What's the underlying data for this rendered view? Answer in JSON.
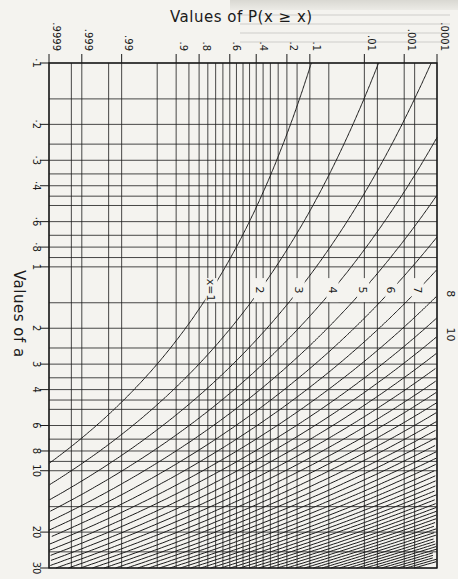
{
  "chart_data": {
    "type": "line",
    "title": "Values of P(x ≥ x)",
    "xlabel": "Values of P(x ≥ x)",
    "ylabel": "Values of a",
    "x_axis": {
      "scale": "normal-probability",
      "position": "top",
      "ticks": [
        ".9999",
        ".999",
        ".99",
        ".9",
        ".8",
        ".6",
        ".4",
        ".2",
        ".1",
        ".01",
        ".001",
        ".0001"
      ],
      "tick_values": [
        0.9999,
        0.999,
        0.99,
        0.9,
        0.8,
        0.6,
        0.4,
        0.2,
        0.1,
        0.01,
        0.001,
        0.0001
      ],
      "minor_gridlines": [
        0.9995,
        0.995,
        0.95,
        0.85,
        0.75,
        0.7,
        0.65,
        0.55,
        0.5,
        0.45,
        0.35,
        0.3,
        0.25,
        0.15,
        0.05,
        0.005,
        0.0005
      ],
      "range": [
        0.9999,
        0.0001
      ]
    },
    "y_axis": {
      "scale": "log",
      "ticks": [
        "·1",
        "·2",
        "·3",
        "·4",
        "·6",
        "·8",
        "1",
        "2",
        "3",
        "4",
        "6",
        "8",
        "10",
        "20",
        "30"
      ],
      "tick_values": [
        0.1,
        0.2,
        0.3,
        0.4,
        0.6,
        0.8,
        1,
        2,
        3,
        4,
        6,
        8,
        10,
        20,
        30
      ],
      "minor_gridlines": [
        0.15,
        0.25,
        0.35,
        0.45,
        0.5,
        0.7,
        0.9,
        1.5,
        2.5,
        3.5,
        4.5,
        5,
        7,
        9,
        15,
        25
      ],
      "range": [
        0.1,
        30
      ]
    },
    "grid": true,
    "series_labels_visible": [
      "x=1",
      "2",
      "3",
      "4",
      "5",
      "6",
      "7",
      "8",
      "10"
    ],
    "series": [
      {
        "name": "x=1",
        "x": 1
      },
      {
        "name": "2",
        "x": 2
      },
      {
        "name": "3",
        "x": 3
      },
      {
        "name": "4",
        "x": 4
      },
      {
        "name": "5",
        "x": 5
      },
      {
        "name": "6",
        "x": 6
      },
      {
        "name": "7",
        "x": 7
      },
      {
        "name": "8",
        "x": 8
      },
      {
        "name": "9",
        "x": 9
      },
      {
        "name": "10",
        "x": 10
      },
      {
        "name": "11",
        "x": 11
      },
      {
        "name": "12",
        "x": 12
      },
      {
        "name": "13",
        "x": 13
      },
      {
        "name": "14",
        "x": 14
      },
      {
        "name": "15",
        "x": 15
      },
      {
        "name": "16",
        "x": 16
      },
      {
        "name": "17",
        "x": 17
      },
      {
        "name": "18",
        "x": 18
      },
      {
        "name": "19",
        "x": 19
      },
      {
        "name": "20",
        "x": 20
      },
      {
        "name": "21",
        "x": 21
      },
      {
        "name": "22",
        "x": 22
      },
      {
        "name": "23",
        "x": 23
      },
      {
        "name": "24",
        "x": 24
      },
      {
        "name": "25",
        "x": 25
      },
      {
        "name": "26",
        "x": 26
      },
      {
        "name": "27",
        "x": 27
      },
      {
        "name": "28",
        "x": 28
      },
      {
        "name": "29",
        "x": 29
      },
      {
        "name": "30",
        "x": 30
      },
      {
        "name": "31",
        "x": 31
      },
      {
        "name": "32",
        "x": 32
      },
      {
        "name": "33",
        "x": 33
      },
      {
        "name": "34",
        "x": 34
      },
      {
        "name": "35",
        "x": 35
      },
      {
        "name": "36",
        "x": 36
      },
      {
        "name": "37",
        "x": 37
      },
      {
        "name": "38",
        "x": 38
      },
      {
        "name": "39",
        "x": 39
      },
      {
        "name": "40",
        "x": 40
      },
      {
        "name": "41",
        "x": 41
      },
      {
        "name": "42",
        "x": 42
      },
      {
        "name": "43",
        "x": 43
      },
      {
        "name": "44",
        "x": 44
      },
      {
        "name": "45",
        "x": 45
      },
      {
        "name": "46",
        "x": 46
      },
      {
        "name": "47",
        "x": 47
      },
      {
        "name": "48",
        "x": 48
      },
      {
        "name": "49",
        "x": 49
      },
      {
        "name": "50",
        "x": 50
      }
    ],
    "curve_label_positions": [
      {
        "label": "x=1",
        "a": 1.3
      },
      {
        "label": "2",
        "a": 1.3
      },
      {
        "label": "3",
        "a": 1.3
      },
      {
        "label": "4",
        "a": 1.3
      },
      {
        "label": "5",
        "a": 1.3
      },
      {
        "label": "6",
        "a": 1.3
      },
      {
        "label": "7",
        "a": 1.3
      }
    ]
  },
  "labels": {
    "title": "Values of P(x ≥ x)",
    "y_title": "Values of a"
  },
  "colors": {
    "ink": "#1a1a1a",
    "paper": "#f4f3ef"
  }
}
